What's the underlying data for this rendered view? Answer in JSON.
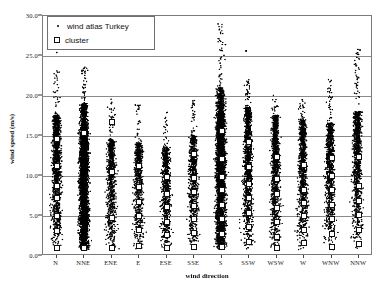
{
  "chart_data": {
    "type": "scatter",
    "title": "",
    "xlabel": "wind direction",
    "ylabel": "wind speed (m/s)",
    "ylim": [
      0.0,
      30.0
    ],
    "yticks": [
      "0.0",
      "5.0",
      "10.0",
      "15.0",
      "20.0",
      "25.0",
      "30.0"
    ],
    "ytick_values": [
      0,
      5,
      10,
      15,
      20,
      25,
      30
    ],
    "grid": true,
    "grid_axis": "y",
    "legend_position": "upper-left",
    "categories": [
      "N",
      "NNE",
      "ENE",
      "E",
      "ESE",
      "SSE",
      "S",
      "SSW",
      "WSW",
      "W",
      "WNW",
      "NNW"
    ],
    "series": [
      {
        "name": "wind atlas Turkey",
        "marker": "dot",
        "color": "#000000",
        "description": "dense vertical point cloud per wind direction category",
        "per_category": [
          {
            "category": "N",
            "n": 1400,
            "min": 0.6,
            "max": 23.2,
            "median": 7.2,
            "dense_top": 15.0,
            "bulk_top": 17.5
          },
          {
            "category": "NNE",
            "n": 1500,
            "min": 0.5,
            "max": 23.6,
            "median": 7.6,
            "dense_top": 16.0,
            "bulk_top": 19.0
          },
          {
            "category": "ENE",
            "n": 900,
            "min": 0.5,
            "max": 19.8,
            "median": 5.4,
            "dense_top": 11.0,
            "bulk_top": 14.5
          },
          {
            "category": "E",
            "n": 800,
            "min": 0.5,
            "max": 19.0,
            "median": 5.0,
            "dense_top": 10.5,
            "bulk_top": 14.0
          },
          {
            "category": "ESE",
            "n": 780,
            "min": 0.5,
            "max": 18.0,
            "median": 4.8,
            "dense_top": 10.0,
            "bulk_top": 13.5
          },
          {
            "category": "SSE",
            "n": 850,
            "min": 0.5,
            "max": 19.5,
            "median": 5.2,
            "dense_top": 11.0,
            "bulk_top": 15.0
          },
          {
            "category": "S",
            "n": 1600,
            "min": 0.5,
            "max": 29.0,
            "median": 8.6,
            "dense_top": 17.5,
            "bulk_top": 21.0
          },
          {
            "category": "SSW",
            "n": 1300,
            "min": 0.5,
            "max": 22.0,
            "median": 7.8,
            "dense_top": 15.5,
            "bulk_top": 18.5
          },
          {
            "category": "WSW",
            "n": 1200,
            "min": 0.5,
            "max": 20.0,
            "median": 7.0,
            "dense_top": 14.5,
            "bulk_top": 17.5
          },
          {
            "category": "W",
            "n": 1100,
            "min": 0.5,
            "max": 19.5,
            "median": 6.4,
            "dense_top": 13.5,
            "bulk_top": 17.0
          },
          {
            "category": "WNW",
            "n": 1000,
            "min": 0.5,
            "max": 22.0,
            "median": 6.0,
            "dense_top": 12.0,
            "bulk_top": 16.5
          },
          {
            "category": "NNW",
            "n": 1150,
            "min": 0.5,
            "max": 25.8,
            "median": 6.8,
            "dense_top": 13.5,
            "bulk_top": 18.0
          }
        ],
        "outliers": [
          {
            "category": "N",
            "value": 29.9
          },
          {
            "category": "N",
            "value": 25.4
          },
          {
            "category": "S",
            "value": 29.0
          },
          {
            "category": "S",
            "value": 26.4
          },
          {
            "category": "SSW",
            "value": 25.6
          },
          {
            "category": "NNW",
            "value": 25.8
          },
          {
            "category": "NNW",
            "value": 25.3
          },
          {
            "category": "NNW",
            "value": 25.7
          },
          {
            "category": "NNW",
            "value": 22.0
          }
        ]
      },
      {
        "name": "cluster",
        "marker": "open-square",
        "color": "#ffffff",
        "edge_color": "#101010",
        "per_category": [
          {
            "category": "N",
            "values": [
              14.6,
              11.2,
              8.8,
              7.3,
              5.0,
              3.1,
              1.0
            ]
          },
          {
            "category": "NNE",
            "values": [
              15.4,
              1.0
            ]
          },
          {
            "category": "ENE",
            "values": [
              16.7,
              10.5,
              4.8,
              1.0
            ]
          },
          {
            "category": "E",
            "values": [
              11.2,
              8.6,
              6.8,
              5.0,
              3.2,
              1.2
            ]
          },
          {
            "category": "ESE",
            "values": [
              9.9,
              7.8,
              6.1,
              4.3,
              2.6,
              1.0
            ]
          },
          {
            "category": "SSE",
            "values": [
              12.8,
              9.8,
              8.0,
              6.3,
              4.6,
              2.9,
              1.1
            ]
          },
          {
            "category": "S",
            "values": [
              15.6,
              12.1,
              9.9,
              8.2,
              6.4,
              4.6,
              2.8,
              1.1
            ]
          },
          {
            "category": "SSW",
            "values": [
              14.3,
              11.1,
              9.0,
              7.2,
              5.4,
              3.6,
              1.8
            ]
          },
          {
            "category": "WSW",
            "values": [
              12.4,
              9.6,
              7.8,
              6.0,
              4.2,
              2.4,
              1.0
            ]
          },
          {
            "category": "W",
            "values": [
              11.4,
              8.3,
              6.6,
              5.0,
              3.3,
              1.6
            ]
          },
          {
            "category": "WNW",
            "values": [
              12.3,
              10.0,
              8.2,
              6.4,
              4.6,
              2.8,
              1.1
            ]
          },
          {
            "category": "NNW",
            "values": [
              12.4,
              8.8,
              6.9,
              5.1,
              3.3,
              1.5
            ]
          }
        ]
      }
    ]
  },
  "legend": {
    "entries": [
      {
        "label": "wind atlas Turkey",
        "marker": "dot"
      },
      {
        "label": "cluster",
        "marker": "open-square"
      }
    ]
  },
  "axes": {
    "x_title": "wind direction",
    "y_title": "wind speed (m/s)"
  },
  "colors": {
    "point": "#000000",
    "cluster_fill": "#ffffff",
    "cluster_edge": "#101010",
    "grid": "#8a8a8a",
    "frame": "#7b7b7b",
    "background": "#ffffff",
    "text": "#1a1a1a"
  }
}
